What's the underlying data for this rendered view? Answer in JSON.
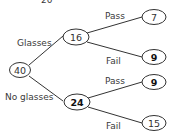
{
  "diagram": {
    "type": "tree",
    "top_cut_text": "20",
    "root": {
      "value": "40"
    },
    "level1": [
      {
        "branch_label": "Glasses",
        "value": "16",
        "bold": false
      },
      {
        "branch_label": "No glasses",
        "value": "24",
        "bold": true
      }
    ],
    "level2": [
      {
        "parent": "Glasses",
        "branch_label": "Pass",
        "value": "7",
        "bold": false
      },
      {
        "parent": "Glasses",
        "branch_label": "Fail",
        "value": "9",
        "bold": true
      },
      {
        "parent": "No glasses",
        "branch_label": "Pass",
        "value": "9",
        "bold": true
      },
      {
        "parent": "No glasses",
        "branch_label": "Fail",
        "value": "15",
        "bold": false
      }
    ],
    "colors": {
      "line": "#333333",
      "text": "#3a3a3a",
      "background": "#ffffff"
    }
  }
}
